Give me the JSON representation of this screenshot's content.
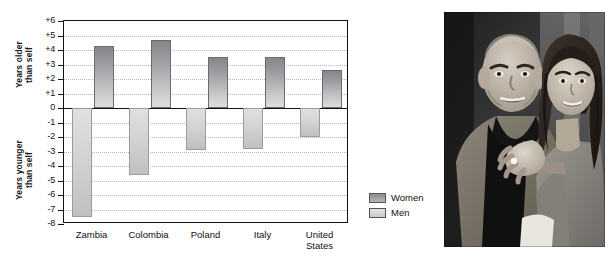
{
  "chart_data": {
    "type": "bar",
    "title": "",
    "xlabel": "",
    "ylabel_upper": "Years older\nthan self",
    "ylabel_lower": "Years younger\nthan self",
    "categories": [
      "Zambia",
      "Colombia",
      "Poland",
      "Italy",
      "United States"
    ],
    "series": [
      {
        "name": "Women",
        "values": [
          4.3,
          4.7,
          3.5,
          3.5,
          2.6
        ],
        "color": "#8a8c8f"
      },
      {
        "name": "Men",
        "values": [
          -7.5,
          -4.6,
          -2.9,
          -2.8,
          -2.0
        ],
        "color": "#d4d5d6"
      }
    ],
    "ylim": [
      -8,
      6
    ],
    "yticks": [
      6,
      5,
      4,
      3,
      2,
      1,
      0,
      -1,
      -2,
      -3,
      -4,
      -5,
      -6,
      -7,
      -8
    ],
    "ytick_labels": [
      "+6",
      "+5",
      "+4",
      "+3",
      "+2",
      "+1",
      "0",
      "-1",
      "-2",
      "-3",
      "-4",
      "-5",
      "-6",
      "-7",
      "-8"
    ],
    "grid": true,
    "legend_position": "right-bottom"
  },
  "axis": {
    "upper_label_line1": "Years older",
    "upper_label_line2": "than self",
    "lower_label_line1": "Years younger",
    "lower_label_line2": "than self"
  },
  "legend": {
    "items": [
      {
        "label": "Women",
        "swatch": "women-swatch"
      },
      {
        "label": "Men",
        "swatch": "men-swatch"
      }
    ]
  },
  "photo": {
    "caption": "",
    "description": "black-and-white photograph of an older bald man and a younger woman with long dark curly hair, both smiling, her hand resting on his chest showing a ring"
  }
}
